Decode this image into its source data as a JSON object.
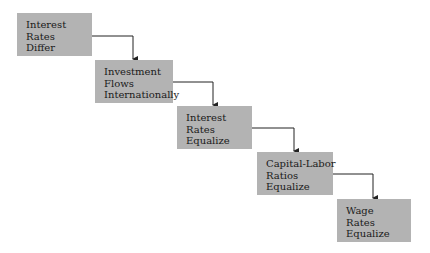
{
  "diagram": {
    "type": "staircase-flow",
    "steps": [
      {
        "lines": [
          "Interest",
          "Rates",
          "Differ"
        ]
      },
      {
        "lines": [
          "Investment",
          "Flows",
          "Internationally"
        ]
      },
      {
        "lines": [
          "Interest",
          "Rates",
          "Equalize"
        ]
      },
      {
        "lines": [
          "Capital-Labor",
          "Ratios",
          "Equalize"
        ]
      },
      {
        "lines": [
          "Wage",
          "Rates",
          "Equalize"
        ]
      }
    ],
    "colors": {
      "box_fill": "#b3b3b3",
      "arrow": "#222222",
      "background": "#ffffff"
    }
  }
}
